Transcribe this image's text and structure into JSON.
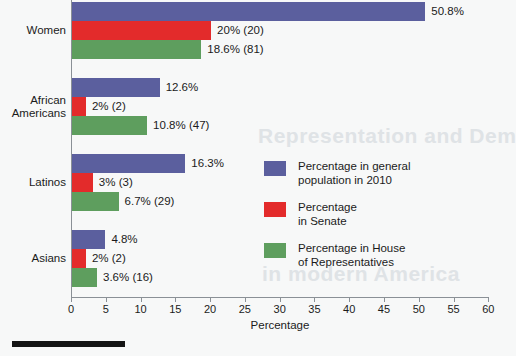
{
  "chart_data": {
    "type": "bar",
    "orientation": "horizontal",
    "title": "",
    "xlabel": "Percentage",
    "ylabel": "",
    "xlim": [
      0,
      60
    ],
    "xticks": [
      0,
      5,
      10,
      15,
      20,
      25,
      30,
      35,
      40,
      45,
      50,
      55,
      60
    ],
    "grid": false,
    "legend_position": "center-right",
    "categories": [
      "Women",
      "African\nAmericans",
      "Latinos",
      "Asians"
    ],
    "series": [
      {
        "name": "Percentage in general\npopulation in 2010",
        "color": "#5b5f9e",
        "values": [
          50.8,
          12.6,
          16.3,
          4.8
        ],
        "labels": [
          "50.8%",
          "12.6%",
          "16.3%",
          "4.8%"
        ]
      },
      {
        "name": "Percentage\nin Senate",
        "color": "#e32b2b",
        "values": [
          20,
          2,
          3,
          2
        ],
        "labels": [
          "20% (20)",
          "2% (2)",
          "3% (3)",
          "2% (2)"
        ]
      },
      {
        "name": "Percentage in House\nof Representatives",
        "color": "#5e9e5e",
        "values": [
          18.6,
          10.8,
          6.7,
          3.6
        ],
        "labels": [
          "18.6% (81)",
          "10.8% (47)",
          "6.7% (29)",
          "3.6% (16)"
        ]
      }
    ]
  },
  "axis": {
    "x_title": "Percentage",
    "tick_labels": [
      "0",
      "5",
      "10",
      "15",
      "20",
      "25",
      "30",
      "35",
      "40",
      "45",
      "50",
      "55",
      "60"
    ]
  },
  "groups": [
    {
      "label": "Women"
    },
    {
      "label": "African\nAmericans"
    },
    {
      "label": "Latinos"
    },
    {
      "label": "Asians"
    }
  ],
  "bars": [
    {
      "value_label": "50.8%"
    },
    {
      "value_label": "20% (20)"
    },
    {
      "value_label": "18.6% (81)"
    },
    {
      "value_label": "12.6%"
    },
    {
      "value_label": "2% (2)"
    },
    {
      "value_label": "10.8% (47)"
    },
    {
      "value_label": "16.3%"
    },
    {
      "value_label": "3% (3)"
    },
    {
      "value_label": "6.7% (29)"
    },
    {
      "value_label": "4.8%"
    },
    {
      "value_label": "2% (2)"
    },
    {
      "value_label": "3.6% (16)"
    }
  ],
  "legend": {
    "items": [
      {
        "label": "Percentage in general\npopulation in 2010",
        "color": "#5b5f9e"
      },
      {
        "label": "Percentage\nin Senate",
        "color": "#e32b2b"
      },
      {
        "label": "Percentage in House\nof Representatives",
        "color": "#5e9e5e"
      }
    ]
  },
  "background_text": {
    "line1": "Representation and Dem",
    "line2": "in modern America"
  },
  "colors": {
    "population": "#5b5f9e",
    "senate": "#e32b2b",
    "house": "#5e9e5e",
    "axis": "#8a9096",
    "background": "#f7f8f8"
  }
}
